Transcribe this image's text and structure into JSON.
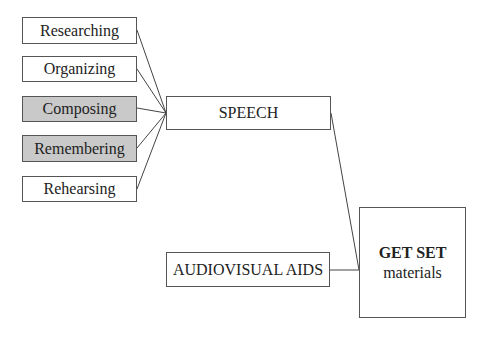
{
  "diagram": {
    "inputs": [
      {
        "label": "Researching",
        "shaded": false
      },
      {
        "label": "Organizing",
        "shaded": false
      },
      {
        "label": "Composing",
        "shaded": true
      },
      {
        "label": "Remembering",
        "shaded": true
      },
      {
        "label": "Rehearsing",
        "shaded": false
      }
    ],
    "speech": {
      "label": "SPEECH"
    },
    "aids": {
      "label": "AUDIOVISUAL AIDS"
    },
    "output": {
      "title": "GET SET",
      "subtitle": "materials"
    },
    "colors": {
      "shaded": "#c9c9c9",
      "border": "#555555",
      "line": "#444444"
    }
  }
}
